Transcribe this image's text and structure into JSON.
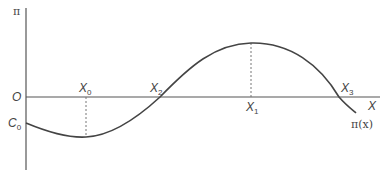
{
  "diagram": {
    "y_axis_label": "π",
    "x_axis_label": "X",
    "origin_label": "O",
    "c0": {
      "main": "C",
      "sub": "0"
    },
    "x0": {
      "main": "X",
      "sub": "0"
    },
    "x1": {
      "main": "X",
      "sub": "1"
    },
    "x2": {
      "main": "X",
      "sub": "2"
    },
    "x3": {
      "main": "X",
      "sub": "3"
    },
    "curve_label": "π(x)",
    "colors": {
      "axis": "#555555",
      "curve": "#444444",
      "dashed": "#777777",
      "text": "#444444"
    }
  }
}
